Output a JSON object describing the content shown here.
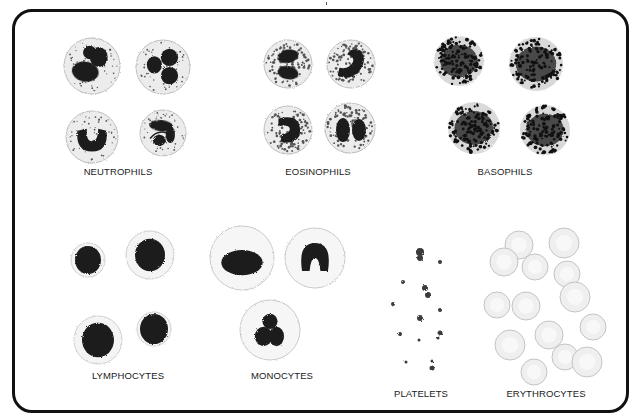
{
  "figure": {
    "title": "",
    "frame": {
      "stroke": "#111111",
      "background": "#ffffff"
    },
    "colors": {
      "nucleus": "#1e1e1e",
      "nucleus_purple": "#2a2a2a",
      "cytoplasm": "#ececec",
      "cytoplasm_edge": "#bdbdbd",
      "granule": "#555555",
      "basophil_granule": "#111111",
      "basophil_body": "#4a4a4a",
      "rbc_fill": "#efefef",
      "rbc_edge": "#c4c4c4",
      "platelet": "#3a3a3a"
    },
    "groups": [
      {
        "id": "neutrophils",
        "label": "NEUTROPHILS",
        "label_pos": [
          118,
          172
        ],
        "type": "neutrophil",
        "cells": [
          {
            "cx": 92,
            "cy": 66,
            "r": 28,
            "nucleus": "lobed3"
          },
          {
            "cx": 163,
            "cy": 67,
            "r": 27,
            "nucleus": "clover"
          },
          {
            "cx": 92,
            "cy": 137,
            "r": 26,
            "nucleus": "horseshoe"
          },
          {
            "cx": 163,
            "cy": 133,
            "r": 23,
            "nucleus": "irregular"
          }
        ]
      },
      {
        "id": "eosinophils",
        "label": "EOSINOPHILS",
        "label_pos": [
          318,
          172
        ],
        "type": "eosinophil",
        "cells": [
          {
            "cx": 288,
            "cy": 64,
            "r": 24,
            "nucleus": "bilobed"
          },
          {
            "cx": 351,
            "cy": 64,
            "r": 24,
            "nucleus": "band"
          },
          {
            "cx": 288,
            "cy": 130,
            "r": 24,
            "nucleus": "kidney"
          },
          {
            "cx": 350,
            "cy": 128,
            "r": 25,
            "nucleus": "bilobed-v"
          }
        ]
      },
      {
        "id": "basophils",
        "label": "BASOPHILS",
        "label_pos": [
          505,
          172
        ],
        "type": "basophil",
        "cells": [
          {
            "cx": 459,
            "cy": 61,
            "r": 25
          },
          {
            "cx": 536,
            "cy": 64,
            "r": 27
          },
          {
            "cx": 474,
            "cy": 128,
            "r": 26
          },
          {
            "cx": 545,
            "cy": 130,
            "r": 25
          }
        ]
      },
      {
        "id": "lymphocytes",
        "label": "LYMPHOCYTES",
        "label_pos": [
          128,
          376
        ],
        "type": "lymphocyte",
        "cells": [
          {
            "cx": 88,
            "cy": 260,
            "r": 17,
            "nr": 13
          },
          {
            "cx": 150,
            "cy": 255,
            "r": 24,
            "nr": 15
          },
          {
            "cx": 98,
            "cy": 340,
            "r": 24,
            "nr": 16
          },
          {
            "cx": 154,
            "cy": 329,
            "r": 17,
            "nr": 14
          }
        ]
      },
      {
        "id": "monocytes",
        "label": "MONOCYTES",
        "label_pos": [
          282,
          376
        ],
        "type": "monocyte",
        "cells": [
          {
            "cx": 242,
            "cy": 258,
            "r": 32,
            "nucleus": "oval"
          },
          {
            "cx": 315,
            "cy": 258,
            "r": 30,
            "nucleus": "m-shape"
          },
          {
            "cx": 270,
            "cy": 330,
            "r": 30,
            "nucleus": "trilobe"
          }
        ]
      },
      {
        "id": "platelets",
        "label": "PLATELETS",
        "label_pos": [
          421,
          394
        ],
        "type": "platelet",
        "cells": [
          {
            "cx": 420,
            "cy": 252,
            "r": 4
          },
          {
            "cx": 420,
            "cy": 258,
            "r": 3
          },
          {
            "cx": 440,
            "cy": 262,
            "r": 2
          },
          {
            "cx": 403,
            "cy": 282,
            "r": 2
          },
          {
            "cx": 425,
            "cy": 288,
            "r": 3
          },
          {
            "cx": 428,
            "cy": 295,
            "r": 3
          },
          {
            "cx": 393,
            "cy": 304,
            "r": 2
          },
          {
            "cx": 440,
            "cy": 310,
            "r": 2
          },
          {
            "cx": 420,
            "cy": 318,
            "r": 3
          },
          {
            "cx": 440,
            "cy": 333,
            "r": 2.5
          },
          {
            "cx": 400,
            "cy": 334,
            "r": 2
          },
          {
            "cx": 419,
            "cy": 340,
            "r": 1.5
          },
          {
            "cx": 438,
            "cy": 338,
            "r": 1.5
          },
          {
            "cx": 406,
            "cy": 362,
            "r": 1.5
          },
          {
            "cx": 432,
            "cy": 368,
            "r": 2.5
          },
          {
            "cx": 432,
            "cy": 361,
            "r": 1.5
          }
        ]
      },
      {
        "id": "erythrocytes",
        "label": "ERYTHROCYTES",
        "label_pos": [
          546,
          394
        ],
        "type": "erythrocyte",
        "cells": [
          {
            "cx": 519,
            "cy": 245,
            "r": 14
          },
          {
            "cx": 564,
            "cy": 243,
            "r": 15
          },
          {
            "cx": 504,
            "cy": 262,
            "r": 14
          },
          {
            "cx": 535,
            "cy": 267,
            "r": 13
          },
          {
            "cx": 567,
            "cy": 274,
            "r": 13
          },
          {
            "cx": 575,
            "cy": 297,
            "r": 15
          },
          {
            "cx": 497,
            "cy": 305,
            "r": 13
          },
          {
            "cx": 526,
            "cy": 306,
            "r": 14
          },
          {
            "cx": 593,
            "cy": 327,
            "r": 13
          },
          {
            "cx": 510,
            "cy": 345,
            "r": 15
          },
          {
            "cx": 549,
            "cy": 335,
            "r": 14
          },
          {
            "cx": 565,
            "cy": 357,
            "r": 13
          },
          {
            "cx": 587,
            "cy": 362,
            "r": 15
          },
          {
            "cx": 534,
            "cy": 372,
            "r": 13
          }
        ]
      }
    ]
  }
}
